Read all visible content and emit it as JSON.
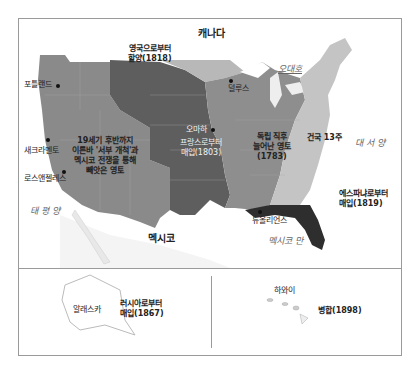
{
  "map": {
    "countries": {
      "canada": "캐나다",
      "mexico": "멕시코"
    },
    "water": {
      "great_lakes": "오대호",
      "pacific": "태 평 양",
      "atlantic": "대 서 양",
      "gulf": "멕시코 만"
    },
    "cities": {
      "portland": "포틀랜드",
      "sacramento": "새크라멘토",
      "los_angeles": "로스앤젤레스",
      "omaha": "오마하",
      "duluth": "덜루스",
      "new_orleans": "뉴올리언스"
    },
    "regions": {
      "britain": {
        "line1": "영국으로부터",
        "line2": "할양(1818)"
      },
      "west": {
        "line1": "19세기 후반까지",
        "line2": "이른바 '서부 개척'과",
        "line3": "멕시코 전쟁을 통해",
        "line4": "빼앗은 영토"
      },
      "louisiana": {
        "line1": "프랑스로부터",
        "line2": "매입(1803)"
      },
      "independence": {
        "line1": "독립 직후",
        "line2": "늘어난 영토",
        "line3": "(1783)"
      },
      "thirteen": {
        "line1": "건국 13주"
      },
      "spain": {
        "line1": "에스파냐로부터",
        "line2": "매입(1819)"
      }
    },
    "colors": {
      "west": "#8a8a8a",
      "louisiana": "#5e5e5e",
      "britain": "#b8b8b8",
      "independence": "#8e8e8e",
      "thirteen": "#c4c4c4",
      "spain": "#2e2e2e",
      "canada": "#ffffff"
    }
  },
  "insets": {
    "alaska": {
      "name": "알래스카",
      "line1": "러시아로부터",
      "line2": "매입(1867)"
    },
    "hawaii": {
      "name": "하와이",
      "label": "병합(1898)"
    }
  }
}
